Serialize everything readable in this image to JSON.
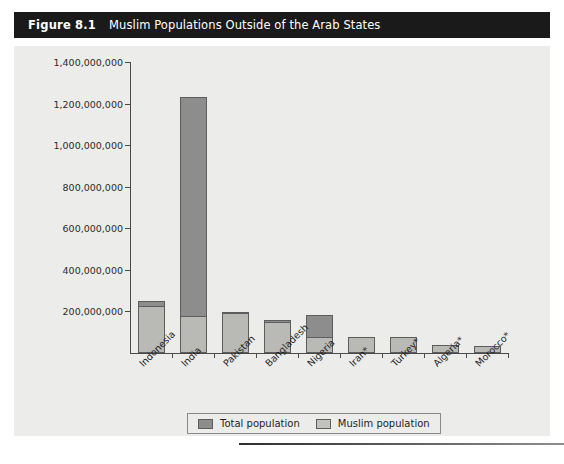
{
  "figure": {
    "number": "Figure 8.1",
    "title": "Muslim Populations Outside of the Arab States"
  },
  "legend": {
    "total_label": "Total population",
    "muslim_label": "Muslim population"
  },
  "chart_data": {
    "type": "bar",
    "title": "Muslim Populations Outside of the Arab States",
    "xlabel": "",
    "ylabel": "",
    "ylim": [
      0,
      1400000000
    ],
    "grid": false,
    "legend_position": "bottom",
    "bar_style": "overlapping",
    "categories": [
      "Indonesia",
      "India",
      "Pakistan",
      "Bangladesh",
      "Nigeria",
      "Iran*",
      "Turkey*",
      "Algeria*",
      "Morocco*"
    ],
    "series": [
      {
        "name": "Total population",
        "values": [
          248000000,
          1230000000,
          196000000,
          160000000,
          185000000,
          78000000,
          79000000,
          39000000,
          33000000
        ]
      },
      {
        "name": "Muslim population",
        "values": [
          225000000,
          177000000,
          193000000,
          148000000,
          78000000,
          77000000,
          77000000,
          38000000,
          32000000
        ]
      }
    ],
    "ytick_labels": [
      "1,400,000,000",
      "1,200,000,000",
      "1,000,000,000",
      "800,000,000",
      "600,000,000",
      "400,000,000",
      "200,000,000"
    ],
    "ytick_values": [
      1400000000,
      1200000000,
      1000000000,
      800000000,
      600000000,
      400000000,
      200000000
    ]
  }
}
